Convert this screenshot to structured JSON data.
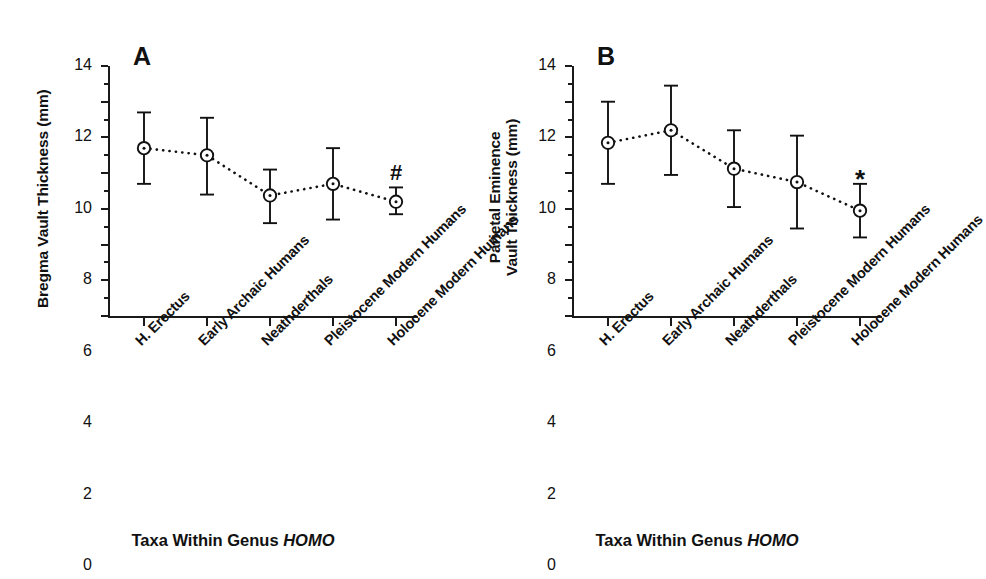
{
  "figure": {
    "background": "#ffffff",
    "ink": "#111111"
  },
  "chart_data": [
    {
      "type": "line",
      "panel": "A",
      "panel_label": "A",
      "title": "",
      "xlabel": "Taxa Within Genus HOMO",
      "xlabel_plain": "Taxa Within Genus ",
      "xlabel_italic": "HOMO",
      "ylabel": "Bregma Vault Thickness (mm)",
      "ylabel_lines": [
        "Bregma Vault Thickness (mm)"
      ],
      "ylim": [
        0,
        14
      ],
      "yticks": [
        0,
        2,
        4,
        6,
        8,
        10,
        12,
        14
      ],
      "ytick_labels": [
        "0",
        "2",
        "4",
        "6",
        "8",
        "10",
        "12",
        "14"
      ],
      "y_minor_ticks": [
        1,
        3,
        5,
        7,
        9,
        11,
        13
      ],
      "grid": false,
      "legend": "none",
      "marker": "open-circle-with-center-dot",
      "linestyle": "dotted",
      "errorbar": "capped",
      "categories": [
        "H. Erectus",
        "Early Archaic Humans",
        "Neathderthals",
        "Pleistocene Modern Humans",
        "Holocene Modern Humans"
      ],
      "values": [
        9.4,
        9.0,
        6.75,
        7.4,
        6.4
      ],
      "err_low": [
        7.4,
        6.8,
        5.2,
        5.4,
        5.7
      ],
      "err_high": [
        11.4,
        11.1,
        8.2,
        9.4,
        7.2
      ],
      "annotations": [
        {
          "text": "#",
          "category_index": 4,
          "y": 8.6
        }
      ]
    },
    {
      "type": "line",
      "panel": "B",
      "panel_label": "B",
      "title": "",
      "xlabel": "Taxa Within Genus HOMO",
      "xlabel_plain": "Taxa Within Genus ",
      "xlabel_italic": "HOMO",
      "ylabel": "Parietal Eminence Vault Thickness (mm)",
      "ylabel_lines": [
        "Parietal Eminence",
        "Vault Thickness (mm)"
      ],
      "ylim": [
        0,
        14
      ],
      "yticks": [
        0,
        2,
        4,
        6,
        8,
        10,
        12,
        14
      ],
      "ytick_labels": [
        "0",
        "2",
        "4",
        "6",
        "8",
        "10",
        "12",
        "14"
      ],
      "y_minor_ticks": [
        1,
        3,
        5,
        7,
        9,
        11,
        13
      ],
      "grid": false,
      "legend": "none",
      "marker": "open-circle-with-center-dot",
      "linestyle": "dotted",
      "errorbar": "capped",
      "categories": [
        "H. Erectus",
        "Early Archaic Humans",
        "Neathderthals",
        "Pleistocene Modern Humans",
        "Holocene Modern Humans"
      ],
      "values": [
        9.7,
        10.4,
        8.25,
        7.5,
        5.9
      ],
      "err_low": [
        7.4,
        7.9,
        6.1,
        4.9,
        4.4
      ],
      "err_high": [
        12.0,
        12.9,
        10.4,
        10.1,
        7.4
      ],
      "annotations": [
        {
          "text": "*",
          "category_index": 4,
          "y": 8.4
        }
      ]
    }
  ]
}
